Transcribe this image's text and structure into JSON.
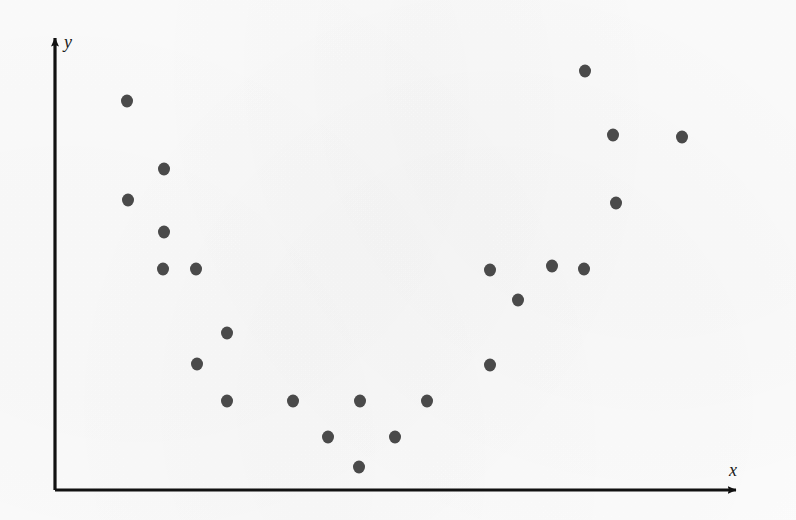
{
  "figure": {
    "background_color": "#fdfdfd",
    "point_color": "#4a4a4a",
    "axis_color": "#111111",
    "point_radius": 6
  },
  "axes": {
    "x_label": "x",
    "y_label": "y",
    "origin": {
      "x": 55,
      "y": 490
    },
    "x_axis_end": {
      "x": 745,
      "y": 490
    },
    "y_axis_end": {
      "x": 55,
      "y": 32
    },
    "x_label_position": {
      "x": 729,
      "y": 461
    },
    "y_label_position": {
      "x": 64,
      "y": 33
    }
  },
  "chart_data": {
    "type": "scatter",
    "title": "",
    "subtitle": "",
    "xlabel": "x",
    "ylabel": "y",
    "grid": false,
    "legend": null,
    "axis_style": "arrow-axes, no tick marks, no tick labels",
    "shape_description": "U-shaped (quadratic / parabolic) relationship: y is high at both low and high x, with a minimum near the middle of the x range",
    "xlim": [
      55,
      745
    ],
    "ylim": [
      32,
      490
    ],
    "n_points": 22,
    "pixel_points": [
      {
        "px": 127,
        "py": 101
      },
      {
        "px": 164,
        "py": 169
      },
      {
        "px": 128,
        "py": 200
      },
      {
        "px": 164,
        "py": 232
      },
      {
        "px": 163,
        "py": 269
      },
      {
        "px": 196,
        "py": 269
      },
      {
        "px": 227,
        "py": 333
      },
      {
        "px": 197,
        "py": 364
      },
      {
        "px": 227,
        "py": 401
      },
      {
        "px": 293,
        "py": 401
      },
      {
        "px": 328,
        "py": 437
      },
      {
        "px": 359,
        "py": 467
      },
      {
        "px": 360,
        "py": 401
      },
      {
        "px": 395,
        "py": 437
      },
      {
        "px": 427,
        "py": 401
      },
      {
        "px": 490,
        "py": 365
      },
      {
        "px": 490,
        "py": 270
      },
      {
        "px": 518,
        "py": 300
      },
      {
        "px": 552,
        "py": 266
      },
      {
        "px": 584,
        "py": 269
      },
      {
        "px": 585,
        "py": 71
      },
      {
        "px": 613,
        "py": 135
      },
      {
        "px": 616,
        "py": 203
      },
      {
        "px": 682,
        "py": 137
      }
    ],
    "x": [
      0.1,
      0.16,
      0.11,
      0.16,
      0.16,
      0.2,
      0.25,
      0.21,
      0.25,
      0.34,
      0.4,
      0.44,
      0.44,
      0.49,
      0.54,
      0.63,
      0.63,
      0.67,
      0.72,
      0.77,
      0.77,
      0.81,
      0.81,
      0.91
    ],
    "y": [
      0.85,
      0.7,
      0.63,
      0.56,
      0.48,
      0.48,
      0.34,
      0.27,
      0.19,
      0.19,
      0.12,
      0.05,
      0.19,
      0.12,
      0.19,
      0.27,
      0.48,
      0.41,
      0.49,
      0.48,
      0.91,
      0.77,
      0.63,
      0.77
    ]
  }
}
